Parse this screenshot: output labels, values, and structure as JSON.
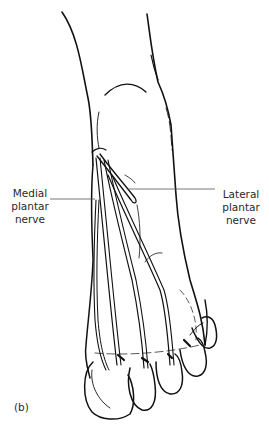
{
  "figure": {
    "panel_label": "(b)",
    "labels": {
      "medial": [
        "Medial",
        "plantar",
        "nerve"
      ],
      "lateral": [
        "Lateral",
        "plantar",
        "nerve"
      ]
    },
    "colors": {
      "ink": "#111111",
      "leader_line": "#555555",
      "background": "#ffffff"
    }
  }
}
